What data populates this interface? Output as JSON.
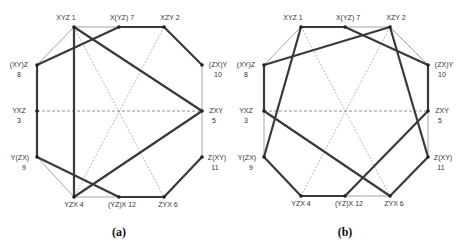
{
  "figures": [
    {
      "caption": "(a)",
      "caption_pos": [
        119,
        236
      ],
      "nodes": [
        {
          "id": 1,
          "name": "XYZ",
          "label": "XYZ  1",
          "x": 74,
          "y": 27,
          "lx": 66,
          "ly": 20,
          "anchor": "middle"
        },
        {
          "id": 7,
          "name": "X(YZ)",
          "label": "X(YZ) 7",
          "x": 119,
          "y": 27,
          "lx": 122,
          "ly": 20,
          "anchor": "middle"
        },
        {
          "id": 2,
          "name": "XZY",
          "label": "XZY  2",
          "x": 164,
          "y": 27,
          "lx": 170,
          "ly": 20,
          "anchor": "middle"
        },
        {
          "id": 8,
          "name": "(XY)Z",
          "label": "(XY)Z",
          "num": "8",
          "x": 37,
          "y": 65,
          "lx": 19,
          "ly": 67,
          "anchor": "middle",
          "nx": 19,
          "ny": 77
        },
        {
          "id": 10,
          "name": "(ZX)Y",
          "label": "(ZX)Y",
          "num": "10",
          "x": 202,
          "y": 65,
          "lx": 218,
          "ly": 67,
          "anchor": "middle",
          "nx": 218,
          "ny": 77
        },
        {
          "id": 3,
          "name": "YXZ",
          "label": "YXZ",
          "num": "3",
          "x": 37,
          "y": 111,
          "lx": 19,
          "ly": 113,
          "anchor": "middle",
          "nx": 19,
          "ny": 123
        },
        {
          "id": 5,
          "name": "ZXY",
          "label": "ZXY",
          "num": "5",
          "x": 202,
          "y": 111,
          "lx": 216,
          "ly": 113,
          "anchor": "middle",
          "nx": 214,
          "ny": 123
        },
        {
          "id": 9,
          "name": "Y(ZX)",
          "label": "Y(ZX)",
          "num": "9",
          "x": 37,
          "y": 157,
          "lx": 20,
          "ly": 160,
          "anchor": "middle",
          "nx": 24,
          "ny": 170
        },
        {
          "id": 11,
          "name": "Z(XY)",
          "label": "Z(XY)",
          "num": "11",
          "x": 202,
          "y": 157,
          "lx": 217,
          "ly": 160,
          "anchor": "middle",
          "nx": 215,
          "ny": 170
        },
        {
          "id": 4,
          "name": "YZX",
          "label": "YZX 4",
          "x": 74,
          "y": 197,
          "lx": 74,
          "ly": 207,
          "anchor": "middle"
        },
        {
          "id": 12,
          "name": "(YZ)X",
          "label": "(YZ)X 12",
          "x": 119,
          "y": 197,
          "lx": 122,
          "ly": 207,
          "anchor": "middle"
        },
        {
          "id": 6,
          "name": "ZYX",
          "label": "ZYX 6",
          "x": 164,
          "y": 197,
          "lx": 168,
          "ly": 207,
          "anchor": "middle"
        }
      ],
      "edges": [
        {
          "a": 1,
          "b": 7,
          "style": "thin"
        },
        {
          "a": 1,
          "b": 8,
          "style": "thin"
        },
        {
          "a": 10,
          "b": 5,
          "style": "thin"
        },
        {
          "a": 5,
          "b": 11,
          "style": "thin"
        },
        {
          "a": 9,
          "b": 4,
          "style": "thin"
        },
        {
          "a": 4,
          "b": 12,
          "style": "thin"
        },
        {
          "a": 1,
          "b": 6,
          "style": "dot"
        },
        {
          "a": 2,
          "b": 4,
          "style": "dot"
        },
        {
          "a": 3,
          "b": 5,
          "style": "dash"
        },
        {
          "a": 1,
          "b": 5,
          "style": "thick"
        },
        {
          "a": 1,
          "b": 4,
          "style": "thick"
        },
        {
          "a": 8,
          "b": 7,
          "style": "thick"
        },
        {
          "a": 7,
          "b": 2,
          "style": "thick"
        },
        {
          "a": 2,
          "b": 10,
          "style": "thick"
        },
        {
          "a": 8,
          "b": 3,
          "style": "thick"
        },
        {
          "a": 3,
          "b": 9,
          "style": "thick"
        },
        {
          "a": 9,
          "b": 12,
          "style": "thick"
        },
        {
          "a": 12,
          "b": 6,
          "style": "thick"
        },
        {
          "a": 6,
          "b": 11,
          "style": "thick"
        },
        {
          "a": 4,
          "b": 5,
          "style": "thick"
        }
      ]
    },
    {
      "caption": "(b)",
      "caption_pos": [
        345,
        236
      ],
      "nodes": [
        {
          "id": 1,
          "name": "XYZ",
          "label": "XYZ  1",
          "x": 301,
          "y": 27,
          "lx": 293,
          "ly": 20,
          "anchor": "middle"
        },
        {
          "id": 7,
          "name": "X(YZ)",
          "label": "X(YZ) 7",
          "x": 345,
          "y": 27,
          "lx": 348,
          "ly": 20,
          "anchor": "middle"
        },
        {
          "id": 2,
          "name": "XZY",
          "label": "XZY  2",
          "x": 390,
          "y": 27,
          "lx": 396,
          "ly": 20,
          "anchor": "middle"
        },
        {
          "id": 8,
          "name": "(XY)Z",
          "label": "(XY)Z",
          "num": "8",
          "x": 264,
          "y": 65,
          "lx": 246,
          "ly": 67,
          "anchor": "middle",
          "nx": 246,
          "ny": 77
        },
        {
          "id": 10,
          "name": "(ZX)Y",
          "label": "(ZX)Y",
          "num": "10",
          "x": 428,
          "y": 65,
          "lx": 444,
          "ly": 67,
          "anchor": "middle",
          "nx": 442,
          "ny": 77
        },
        {
          "id": 3,
          "name": "YXZ",
          "label": "YXZ",
          "num": "3",
          "x": 264,
          "y": 111,
          "lx": 246,
          "ly": 113,
          "anchor": "middle",
          "nx": 246,
          "ny": 123
        },
        {
          "id": 5,
          "name": "ZXY",
          "label": "ZXY",
          "num": "5",
          "x": 428,
          "y": 111,
          "lx": 442,
          "ly": 113,
          "anchor": "middle",
          "nx": 440,
          "ny": 123
        },
        {
          "id": 9,
          "name": "Y(ZX)",
          "label": "Y(ZX)",
          "num": "9",
          "x": 264,
          "y": 157,
          "lx": 247,
          "ly": 160,
          "anchor": "middle",
          "nx": 251,
          "ny": 170
        },
        {
          "id": 11,
          "name": "Z(XY)",
          "label": "Z(XY)",
          "num": "11",
          "x": 428,
          "y": 157,
          "lx": 443,
          "ly": 160,
          "anchor": "middle",
          "nx": 441,
          "ny": 170
        },
        {
          "id": 4,
          "name": "YZX",
          "label": "YZX 4",
          "x": 301,
          "y": 196,
          "lx": 301,
          "ly": 206,
          "anchor": "middle"
        },
        {
          "id": 12,
          "name": "(YZ)X",
          "label": "(YZ)X 12",
          "x": 345,
          "y": 196,
          "lx": 349,
          "ly": 206,
          "anchor": "middle"
        },
        {
          "id": 6,
          "name": "ZYX",
          "label": "ZYX 6",
          "x": 390,
          "y": 196,
          "lx": 394,
          "ly": 206,
          "anchor": "middle"
        }
      ],
      "edges": [
        {
          "a": 1,
          "b": 8,
          "style": "thin"
        },
        {
          "a": 7,
          "b": 2,
          "style": "thin"
        },
        {
          "a": 2,
          "b": 10,
          "style": "thin"
        },
        {
          "a": 3,
          "b": 9,
          "style": "thin"
        },
        {
          "a": 5,
          "b": 11,
          "style": "thin"
        },
        {
          "a": 12,
          "b": 6,
          "style": "thin"
        },
        {
          "a": 1,
          "b": 6,
          "style": "dot"
        },
        {
          "a": 2,
          "b": 4,
          "style": "dot"
        },
        {
          "a": 3,
          "b": 5,
          "style": "dash"
        },
        {
          "a": 1,
          "b": 7,
          "style": "thick"
        },
        {
          "a": 7,
          "b": 10,
          "style": "thick"
        },
        {
          "a": 2,
          "b": 8,
          "style": "thick"
        },
        {
          "a": 2,
          "b": 11,
          "style": "thick"
        },
        {
          "a": 10,
          "b": 5,
          "style": "thick"
        },
        {
          "a": 5,
          "b": 12,
          "style": "thick"
        },
        {
          "a": 11,
          "b": 6,
          "style": "thick"
        },
        {
          "a": 8,
          "b": 3,
          "style": "thick"
        },
        {
          "a": 1,
          "b": 9,
          "style": "thick"
        },
        {
          "a": 3,
          "b": 6,
          "style": "thick"
        },
        {
          "a": 9,
          "b": 4,
          "style": "thick"
        },
        {
          "a": 4,
          "b": 12,
          "style": "thick"
        }
      ]
    }
  ]
}
